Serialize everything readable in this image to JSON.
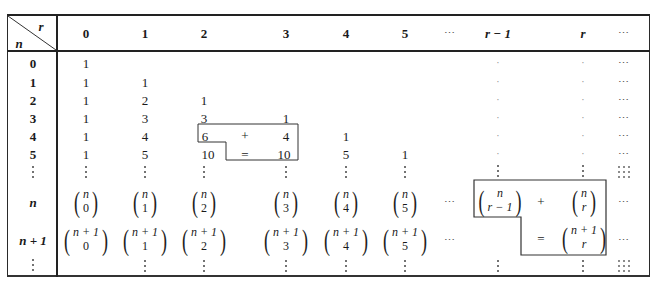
{
  "table": {
    "corner": {
      "col_var": "r",
      "row_var": "n"
    },
    "columns": [
      "0",
      "1",
      "2",
      "3",
      "4",
      "5",
      "⋯",
      "r − 1",
      "r",
      "⋯"
    ],
    "row_labels": [
      "0",
      "1",
      "2",
      "3",
      "4",
      "5",
      "⋮",
      "n",
      "n + 1",
      "⋮"
    ],
    "rows": [
      {
        "label": "0",
        "values": [
          "1",
          "",
          "",
          "",
          "",
          "",
          "",
          "·",
          "·",
          "⋯"
        ]
      },
      {
        "label": "1",
        "values": [
          "1",
          "1",
          "",
          "",
          "",
          "",
          "",
          "·",
          "·",
          "⋯"
        ]
      },
      {
        "label": "2",
        "values": [
          "1",
          "2",
          "1",
          "",
          "",
          "",
          "",
          "·",
          "·",
          "⋯"
        ]
      },
      {
        "label": "3",
        "values": [
          "1",
          "3",
          "3",
          "1",
          "",
          "",
          "",
          "·",
          "·",
          "⋯"
        ]
      },
      {
        "label": "4",
        "values": [
          "1",
          "4",
          "6",
          "4",
          "1",
          "",
          "",
          "·",
          "·",
          "⋯"
        ]
      },
      {
        "label": "5",
        "values": [
          "1",
          "5",
          "10",
          "10",
          "5",
          "1",
          "",
          "·",
          "·",
          "⋯"
        ]
      }
    ],
    "binomial_rows": {
      "n": {
        "top": "n",
        "bottoms": [
          "0",
          "1",
          "2",
          "3",
          "4",
          "5"
        ],
        "r_minus_1": "r − 1",
        "r": "r"
      },
      "n_plus_1": {
        "top": "n + 1",
        "bottoms": [
          "0",
          "1",
          "2",
          "3",
          "4",
          "5"
        ],
        "r": "r"
      }
    },
    "ellipsis_h": "⋯",
    "small_box": {
      "plus": "+",
      "equals": "=",
      "a": "6",
      "b": "4",
      "sum": "10"
    },
    "big_box": {
      "plus": "+",
      "equals": "="
    }
  }
}
